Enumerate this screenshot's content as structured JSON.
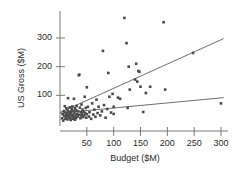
{
  "chart_data": {
    "type": "scatter",
    "title": "",
    "subtitle": "",
    "xlabel": "Budget ($M)",
    "ylabel": "US Gross ($M)",
    "xlim": [
      0,
      315
    ],
    "ylim": [
      0,
      390
    ],
    "xticks": [
      50,
      100,
      150,
      200,
      250,
      300
    ],
    "xtick_labels": [
      "50",
      "100",
      "150",
      "200",
      "250",
      "300"
    ],
    "yticks": [
      100,
      200,
      300
    ],
    "ytick_labels": [
      "100",
      "200",
      "300"
    ],
    "grid": false,
    "legend": "none",
    "point_color": "#4a4a4a",
    "line_color": "#6e6e6e",
    "axis_color": "#7a7a7a",
    "points": [
      [
        4,
        20
      ],
      [
        5,
        34
      ],
      [
        6,
        12
      ],
      [
        7,
        45
      ],
      [
        8,
        28
      ],
      [
        9,
        62
      ],
      [
        10,
        18
      ],
      [
        10,
        40
      ],
      [
        11,
        30
      ],
      [
        12,
        55
      ],
      [
        12,
        22
      ],
      [
        13,
        36
      ],
      [
        14,
        48
      ],
      [
        14,
        16
      ],
      [
        15,
        90
      ],
      [
        15,
        29
      ],
      [
        16,
        41
      ],
      [
        17,
        25
      ],
      [
        18,
        58
      ],
      [
        18,
        33
      ],
      [
        19,
        20
      ],
      [
        20,
        44
      ],
      [
        20,
        14
      ],
      [
        21,
        37
      ],
      [
        22,
        52
      ],
      [
        22,
        27
      ],
      [
        23,
        61
      ],
      [
        24,
        31
      ],
      [
        24,
        18
      ],
      [
        25,
        46
      ],
      [
        26,
        23
      ],
      [
        26,
        88
      ],
      [
        27,
        39
      ],
      [
        28,
        55
      ],
      [
        28,
        15
      ],
      [
        29,
        30
      ],
      [
        30,
        48
      ],
      [
        30,
        21
      ],
      [
        31,
        63
      ],
      [
        32,
        35
      ],
      [
        33,
        26
      ],
      [
        34,
        44
      ],
      [
        35,
        170
      ],
      [
        36,
        172
      ],
      [
        36,
        32
      ],
      [
        37,
        57
      ],
      [
        38,
        20
      ],
      [
        39,
        41
      ],
      [
        40,
        68
      ],
      [
        40,
        29
      ],
      [
        41,
        36
      ],
      [
        42,
        50
      ],
      [
        43,
        24
      ],
      [
        44,
        43
      ],
      [
        45,
        30
      ],
      [
        46,
        95
      ],
      [
        47,
        38
      ],
      [
        48,
        56
      ],
      [
        49,
        22
      ],
      [
        50,
        128
      ],
      [
        50,
        34
      ],
      [
        52,
        60
      ],
      [
        54,
        26
      ],
      [
        55,
        41
      ],
      [
        58,
        18
      ],
      [
        60,
        72
      ],
      [
        62,
        33
      ],
      [
        64,
        50
      ],
      [
        66,
        25
      ],
      [
        68,
        85
      ],
      [
        70,
        38
      ],
      [
        72,
        60
      ],
      [
        75,
        30
      ],
      [
        78,
        44
      ],
      [
        80,
        255
      ],
      [
        82,
        66
      ],
      [
        85,
        22
      ],
      [
        88,
        52
      ],
      [
        90,
        178
      ],
      [
        92,
        95
      ],
      [
        95,
        40
      ],
      [
        98,
        105
      ],
      [
        100,
        60
      ],
      [
        100,
        35
      ],
      [
        108,
        92
      ],
      [
        112,
        88
      ],
      [
        120,
        370
      ],
      [
        124,
        282
      ],
      [
        126,
        56
      ],
      [
        128,
        200
      ],
      [
        130,
        120
      ],
      [
        140,
        155
      ],
      [
        142,
        210
      ],
      [
        144,
        148
      ],
      [
        146,
        185
      ],
      [
        148,
        182
      ],
      [
        150,
        130
      ],
      [
        155,
        42
      ],
      [
        160,
        108
      ],
      [
        168,
        130
      ],
      [
        193,
        355
      ],
      [
        196,
        120
      ],
      [
        248,
        248
      ],
      [
        300,
        72
      ]
    ],
    "lines": [
      {
        "name": "steep-fit-line",
        "x0": 0,
        "y0": 40,
        "x1": 305,
        "y1": 298
      },
      {
        "name": "shallow-fit-line",
        "x0": 0,
        "y0": 38,
        "x1": 305,
        "y1": 92
      }
    ]
  }
}
